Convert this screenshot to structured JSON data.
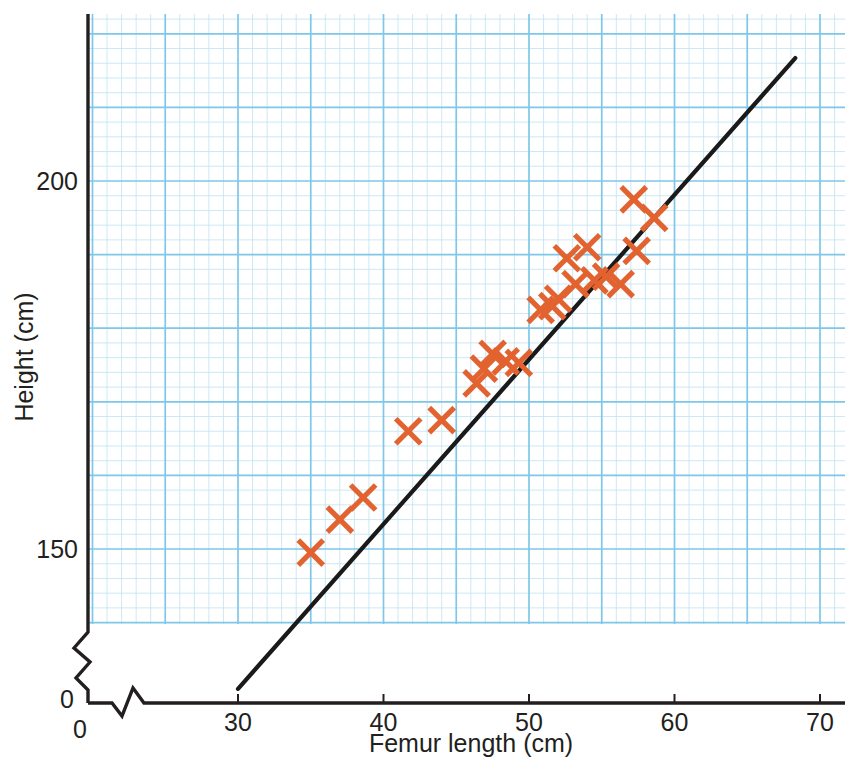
{
  "chart_data": {
    "type": "scatter",
    "title": "",
    "xlabel": "Femur length (cm)",
    "ylabel": "Height (cm)",
    "xlim": [
      30,
      70
    ],
    "ylim": [
      131,
      222
    ],
    "xticks": [
      "30",
      "40",
      "50",
      "60",
      "70"
    ],
    "xtick_values": [
      30,
      40,
      50,
      60,
      70
    ],
    "yticks": [
      "150",
      "200"
    ],
    "ytick_values": [
      150,
      200
    ],
    "origin_label_x": "0",
    "origin_label_y": "0",
    "grid": "graph-paper",
    "grid_major_cm_x": 5,
    "grid_minor_cm_x": 1,
    "grid_major_cm_y": 10,
    "grid_minor_cm_y": 2,
    "axis_break_x": true,
    "axis_break_y": true,
    "legend": "none",
    "marker": "x-cross",
    "marker_color": "#E2632F",
    "line_color": "#1a1a1a",
    "grid_major_color": "#7ec7e8",
    "grid_minor_color": "#bfe2f2",
    "axis_color": "#231f20",
    "points": [
      {
        "x": 35.0,
        "y": 149.5
      },
      {
        "x": 37.0,
        "y": 154.0
      },
      {
        "x": 38.6,
        "y": 157.0
      },
      {
        "x": 41.7,
        "y": 166.0
      },
      {
        "x": 44.0,
        "y": 167.5
      },
      {
        "x": 46.4,
        "y": 172.5
      },
      {
        "x": 46.9,
        "y": 174.5
      },
      {
        "x": 47.5,
        "y": 176.5
      },
      {
        "x": 48.4,
        "y": 175.5
      },
      {
        "x": 49.3,
        "y": 175.3
      },
      {
        "x": 50.8,
        "y": 182.5
      },
      {
        "x": 51.6,
        "y": 183.0
      },
      {
        "x": 52.0,
        "y": 184.0
      },
      {
        "x": 52.6,
        "y": 189.5
      },
      {
        "x": 53.2,
        "y": 186.0
      },
      {
        "x": 54.0,
        "y": 191.0
      },
      {
        "x": 54.5,
        "y": 186.5
      },
      {
        "x": 55.3,
        "y": 187.0
      },
      {
        "x": 56.3,
        "y": 186.0
      },
      {
        "x": 57.2,
        "y": 197.5
      },
      {
        "x": 57.4,
        "y": 190.5
      },
      {
        "x": 58.6,
        "y": 195.0
      }
    ],
    "trend_line": {
      "x1": 30.0,
      "y1": 131.0,
      "x2": 68.3,
      "y2": 216.7,
      "style": "solid"
    }
  }
}
